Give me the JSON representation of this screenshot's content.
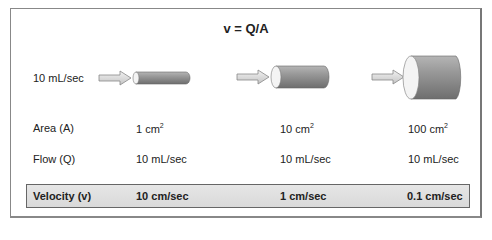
{
  "title": "v = Q/A",
  "inflow_label": "10 mL/sec",
  "rows": {
    "area": {
      "label": "Area (A)",
      "values": [
        {
          "num": "1 cm",
          "sup": "2"
        },
        {
          "num": "10 cm",
          "sup": "2"
        },
        {
          "num": "100 cm",
          "sup": "2"
        }
      ]
    },
    "flow": {
      "label": "Flow (Q)",
      "values": [
        "10 mL/sec",
        "10 mL/sec",
        "10 mL/sec"
      ]
    },
    "velocity": {
      "label": "Velocity (v)",
      "values": [
        "10 cm/sec",
        "1 cm/sec",
        "0.1 cm/sec"
      ]
    }
  },
  "tubes": [
    {
      "name": "small",
      "area": "1 cm2"
    },
    {
      "name": "medium",
      "area": "10 cm2"
    },
    {
      "name": "large",
      "area": "100 cm2"
    }
  ],
  "colors": {
    "tube": "#8a8a8a",
    "arrow": "#d8d8d8",
    "border": "#888888",
    "velocity_bar": "#e0e0e0"
  }
}
